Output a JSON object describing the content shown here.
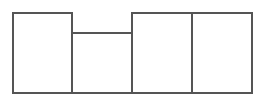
{
  "chart_data": {
    "type": "bar",
    "title": "",
    "xlabel": "",
    "ylabel": "",
    "categories": [
      "",
      "",
      "",
      ""
    ],
    "values": [
      81,
      61,
      81,
      81
    ],
    "ylim": [
      0,
      81
    ],
    "grid": false,
    "legend": null,
    "style": {
      "fill": "#ffffff",
      "stroke": "#555555",
      "stroke_width": 2,
      "bar_width_px": 60,
      "baseline_y_px": 93,
      "first_bar_x_px": 12,
      "gap_px": 0
    }
  }
}
